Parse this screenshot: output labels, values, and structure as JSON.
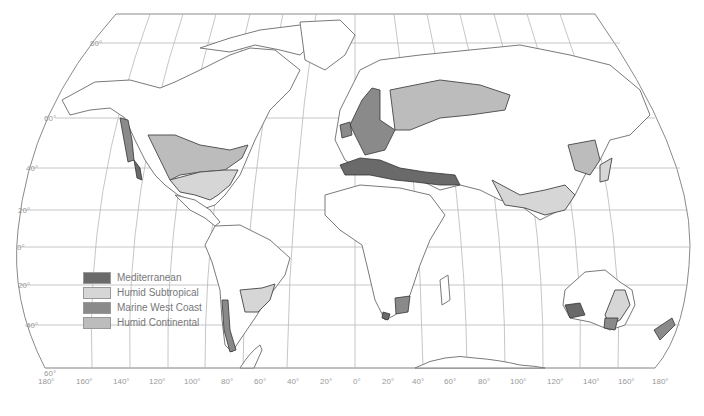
{
  "map": {
    "title": "",
    "projection": "Robinson-like world projection",
    "climate_colors": {
      "mediterranean": "#6a6a6a",
      "humid_subtropical": "#d6d6d6",
      "marine_west_coast": "#8a8a8a",
      "humid_continental": "#bcbcbc"
    },
    "legend": [
      {
        "label": "Mediterranean",
        "color": "#6a6a6a"
      },
      {
        "label": "Humid Subtropical",
        "color": "#d6d6d6"
      },
      {
        "label": "Marine West Coast",
        "color": "#8a8a8a"
      },
      {
        "label": "Humid Continental",
        "color": "#bcbcbc"
      }
    ],
    "latitude_labels": [
      "80°",
      "60°",
      "40°",
      "20°",
      "0°",
      "20°",
      "40°",
      "60°"
    ],
    "longitude_labels": [
      "180°",
      "160°",
      "140°",
      "120°",
      "100°",
      "80°",
      "60°",
      "40°",
      "20°",
      "0°",
      "20°",
      "40°",
      "60°",
      "80°",
      "100°",
      "120°",
      "140°",
      "160°",
      "180°"
    ]
  }
}
